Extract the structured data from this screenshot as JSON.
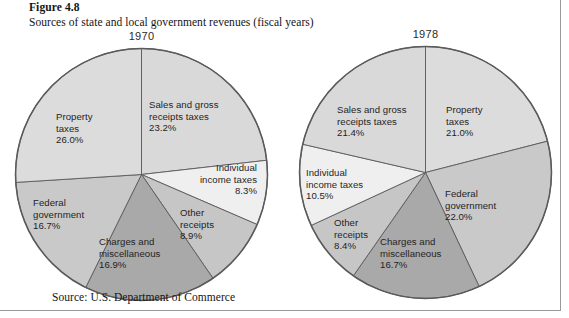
{
  "figure": {
    "number_label": "Figure 4.8",
    "caption": "Sources of state and local government revenues (fiscal years)",
    "source_note": "Source: U.S. Department of Commerce"
  },
  "palette": {
    "slice_light": "#d6d6d6",
    "slice_lighter": "#dcdcdc",
    "slice_pale": "#efefef",
    "slice_medium": "#c2c2c2",
    "slice_dark": "#a9a9a9",
    "outline": "#5a5a5a",
    "text": "#1f1f1f",
    "rule": "#9a9a9a"
  },
  "chart_data": [
    {
      "type": "pie",
      "title": "1970",
      "unit": "percent",
      "start_angle_deg": 0,
      "direction": "clockwise",
      "categories": [
        "Sales and gross receipts taxes",
        "Individual income taxes",
        "Other receipts",
        "Charges and miscellaneous",
        "Federal government",
        "Property taxes"
      ],
      "values": [
        23.2,
        8.3,
        8.9,
        16.9,
        16.7,
        26.0
      ],
      "slices": [
        {
          "id": "sales-gross-receipts-taxes",
          "line1": "Sales and gross",
          "line2": "receipts taxes",
          "pct_text": "23.2%",
          "value": 23.2,
          "color": "#d9d9d9"
        },
        {
          "id": "individual-income-taxes",
          "line1": "Individual",
          "line2": "income taxes",
          "pct_text": "8.3%",
          "value": 8.3,
          "color": "#efefef"
        },
        {
          "id": "other-receipts",
          "line1": "Other",
          "line2": "receipts",
          "pct_text": "8.9%",
          "value": 8.9,
          "color": "#c6c6c6"
        },
        {
          "id": "charges-and-miscellaneous",
          "line1": "Charges and",
          "line2": "miscellaneous",
          "pct_text": "16.9%",
          "value": 16.9,
          "color": "#a9a9a9"
        },
        {
          "id": "federal-government",
          "line1": "Federal",
          "line2": "government",
          "pct_text": "16.7%",
          "value": 16.7,
          "color": "#c9c9c9"
        },
        {
          "id": "property-taxes",
          "line1": "Property",
          "line2": "taxes",
          "pct_text": "26.0%",
          "value": 26.0,
          "color": "#dcdcdc"
        }
      ]
    },
    {
      "type": "pie",
      "title": "1978",
      "unit": "percent",
      "start_angle_deg": 0,
      "direction": "clockwise",
      "categories": [
        "Property taxes",
        "Federal government",
        "Charges and miscellaneous",
        "Other receipts",
        "Individual income taxes",
        "Sales and gross receipts taxes"
      ],
      "values": [
        21.0,
        22.0,
        16.7,
        8.4,
        10.5,
        21.4
      ],
      "slices": [
        {
          "id": "property-taxes",
          "line1": "Property",
          "line2": "taxes",
          "pct_text": "21.0%",
          "value": 21.0,
          "color": "#dcdcdc"
        },
        {
          "id": "federal-government",
          "line1": "Federal",
          "line2": "government",
          "pct_text": "22.0%",
          "value": 22.0,
          "color": "#c9c9c9"
        },
        {
          "id": "charges-and-miscellaneous",
          "line1": "Charges and",
          "line2": "miscellaneous",
          "pct_text": "16.7%",
          "value": 16.7,
          "color": "#a9a9a9"
        },
        {
          "id": "other-receipts",
          "line1": "Other",
          "line2": "receipts",
          "pct_text": "8.4%",
          "value": 8.4,
          "color": "#c6c6c6"
        },
        {
          "id": "individual-income-taxes",
          "line1": "Individual",
          "line2": "income taxes",
          "pct_text": "10.5%",
          "value": 10.5,
          "color": "#efefef"
        },
        {
          "id": "sales-gross-receipts-taxes",
          "line1": "Sales and gross",
          "line2": "receipts taxes",
          "pct_text": "21.4%",
          "value": 21.4,
          "color": "#d9d9d9"
        }
      ]
    }
  ]
}
